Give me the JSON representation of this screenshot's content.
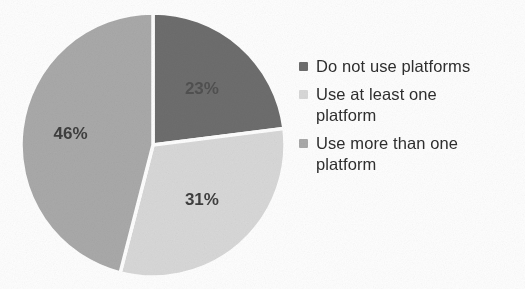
{
  "chart_data": {
    "type": "pie",
    "title": "",
    "subtitle": "",
    "xlabel": "",
    "ylabel": "",
    "grid": false,
    "legend_position": "right",
    "start_angle_deg": 0,
    "direction": "clockwise",
    "categories": [
      "Do not use platforms",
      "Use at least one platform",
      "Use more than one platform"
    ],
    "values": [
      23,
      31,
      46
    ],
    "data_labels": [
      "23%",
      "31%",
      "46%"
    ],
    "colors": [
      "#6e6e6e",
      "#d9d9d9",
      "#aaaaaa"
    ],
    "series": [
      {
        "name": "Platform usage",
        "values": [
          23,
          31,
          46
        ]
      }
    ]
  },
  "legend": {
    "items": [
      {
        "label": "Do not use platforms",
        "color": "#6e6e6e"
      },
      {
        "label": "Use at least one platform",
        "color": "#d9d9d9"
      },
      {
        "label": "Use more than one platform",
        "color": "#aaaaaa"
      }
    ]
  },
  "pie": {
    "slices": [
      {
        "name": "do-not-use",
        "label": "23%",
        "color": "#6e6e6e"
      },
      {
        "name": "use-at-least-one",
        "label": "31%",
        "color": "#d9d9d9"
      },
      {
        "name": "use-more-than-one",
        "label": "46%",
        "color": "#aaaaaa"
      }
    ],
    "separator_color": "#ffffff"
  }
}
